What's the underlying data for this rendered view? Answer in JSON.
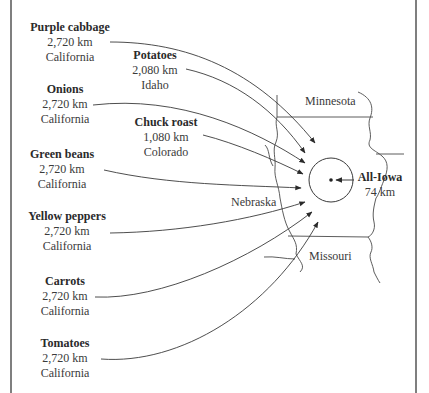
{
  "diagram": {
    "type": "food-miles-flow-map",
    "destination": {
      "name": "All-Iowa",
      "distance": "74 km"
    },
    "sources": [
      {
        "name": "Purple cabbage",
        "distance": "2,720 km",
        "origin": "California"
      },
      {
        "name": "Potatoes",
        "distance": "2,080 km",
        "origin": "Idaho"
      },
      {
        "name": "Onions",
        "distance": "2,720 km",
        "origin": "California"
      },
      {
        "name": "Chuck roast",
        "distance": "1,080 km",
        "origin": "Colorado"
      },
      {
        "name": "Green beans",
        "distance": "2,720 km",
        "origin": "California"
      },
      {
        "name": "Yellow peppers",
        "distance": "2,720 km",
        "origin": "California"
      },
      {
        "name": "Carrots",
        "distance": "2,720 km",
        "origin": "California"
      },
      {
        "name": "Tomatoes",
        "distance": "2,720 km",
        "origin": "California"
      }
    ],
    "states": {
      "minnesota": "Minnesota",
      "nebraska": "Nebraska",
      "missouri": "Missouri"
    },
    "colors": {
      "line": "#3a3a3a",
      "text": "#333333",
      "background": "#ffffff"
    }
  }
}
